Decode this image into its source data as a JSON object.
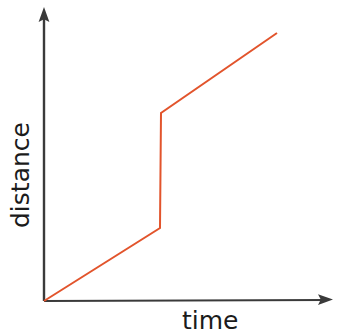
{
  "figure": {
    "background_color": "#ffffff",
    "width": 337,
    "height": 336
  },
  "axes": {
    "color": "#3a3a3a",
    "x_axis_label": "time",
    "y_axis_label": "distance",
    "x_axis_has_arrow": true,
    "y_axis_has_arrow": true,
    "origin": {
      "x": 44,
      "y": 301
    },
    "x_axis_end": {
      "x": 332,
      "y": 301
    },
    "y_axis_end": {
      "x": 44,
      "y": 8
    }
  },
  "chart_data": {
    "type": "line",
    "title": "",
    "xlabel": "time",
    "ylabel": "distance",
    "grid": false,
    "legend": null,
    "axis_ticks": {
      "x": [],
      "y": []
    },
    "xlim": [
      0,
      1
    ],
    "ylim": [
      0,
      1
    ],
    "series": [
      {
        "name": "distance vs time",
        "color": "#e2542c",
        "line_width": 2,
        "annotation": "piecewise: steady rise, instantaneous jump, then steady rise",
        "points_px": [
          {
            "x": 44,
            "y": 301
          },
          {
            "x": 160,
            "y": 228
          },
          {
            "x": 161,
            "y": 113
          },
          {
            "x": 277,
            "y": 33
          }
        ],
        "x": [
          0.0,
          0.4,
          0.41,
          0.81
        ],
        "y": [
          0.0,
          0.25,
          0.64,
          0.91
        ]
      }
    ]
  }
}
